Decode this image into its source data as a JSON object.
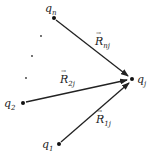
{
  "diagram": {
    "type": "vector-diagram",
    "charges": [
      {
        "id": "qn",
        "base": "q",
        "sub": "n",
        "x": 54,
        "y": 18
      },
      {
        "id": "q2",
        "base": "q",
        "sub": "2",
        "x": 23,
        "y": 103
      },
      {
        "id": "q1",
        "base": "q",
        "sub": "1",
        "x": 59,
        "y": 144
      },
      {
        "id": "qj",
        "base": "q",
        "sub": "j",
        "x": 132,
        "y": 79
      }
    ],
    "ellipsis_dots": [
      {
        "x": 41,
        "y": 36
      },
      {
        "x": 32,
        "y": 56
      },
      {
        "x": 26,
        "y": 78
      }
    ],
    "vectors": [
      {
        "from": "qn",
        "to": "qj",
        "base": "R",
        "sub": "nj"
      },
      {
        "from": "q2",
        "to": "qj",
        "base": "R",
        "sub": "2j"
      },
      {
        "from": "q1",
        "to": "qj",
        "base": "R",
        "sub": "1j"
      }
    ],
    "labels": {
      "qn": {
        "base": "q",
        "sub": "n"
      },
      "q2": {
        "base": "q",
        "sub": "2"
      },
      "q1": {
        "base": "q",
        "sub": "1"
      },
      "qj": {
        "base": "q",
        "sub": "j"
      },
      "Rnj": {
        "base": "R",
        "sub": "nj"
      },
      "R2j": {
        "base": "R",
        "sub": "2j"
      },
      "R1j": {
        "base": "R",
        "sub": "1j"
      }
    },
    "colors": {
      "line": "#222222",
      "text": "#222222",
      "background": "#ffffff"
    }
  }
}
